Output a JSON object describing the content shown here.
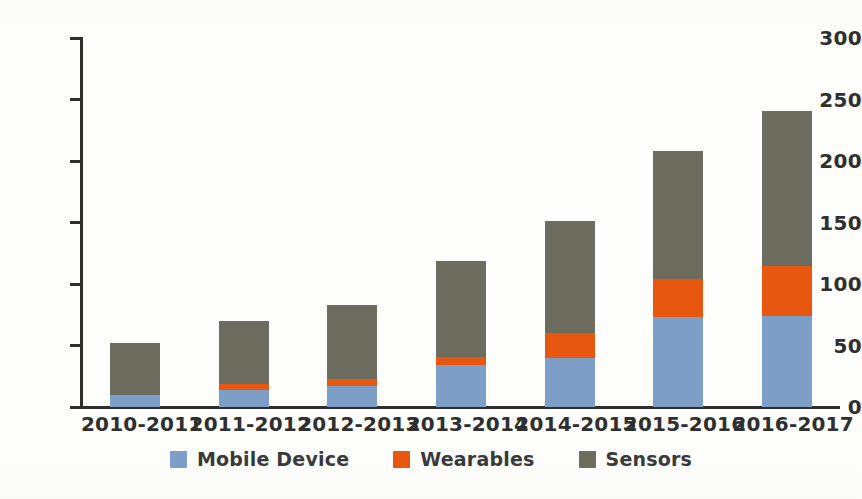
{
  "chart_data": {
    "type": "bar",
    "stacked": true,
    "title": "",
    "subtitle": "",
    "xlabel": "",
    "ylabel": "",
    "ylim": [
      0,
      300
    ],
    "yticks": [
      0,
      50,
      100,
      150,
      200,
      250,
      300
    ],
    "grid": false,
    "legend_position": "bottom-center",
    "categories": [
      "2010-2011",
      "2011-2012",
      "2012-2013",
      "2013-2014",
      "2014-2015",
      "2015-2016",
      "2016-2017"
    ],
    "series": [
      {
        "name": "Mobile Device",
        "color": "#7d9ec7",
        "values": [
          10,
          14,
          17,
          34,
          40,
          73,
          74
        ]
      },
      {
        "name": "Wearables",
        "color": "#e8570f",
        "values": [
          0,
          5,
          6,
          7,
          20,
          31,
          41
        ]
      },
      {
        "name": "Sensors",
        "color": "#6d6d5f",
        "values": [
          42,
          51,
          60,
          78,
          91,
          104,
          126
        ]
      }
    ],
    "totals": [
      52,
      70,
      83,
      119,
      151,
      208,
      241
    ]
  },
  "axis": {
    "y_tick_labels": [
      "0",
      "50",
      "100",
      "150",
      "200",
      "250",
      "300"
    ]
  },
  "legend": {
    "items": [
      {
        "label": "Mobile Device",
        "color": "#7d9ec7"
      },
      {
        "label": "Wearables",
        "color": "#e8570f"
      },
      {
        "label": "Sensors",
        "color": "#6d6d5f"
      }
    ]
  }
}
